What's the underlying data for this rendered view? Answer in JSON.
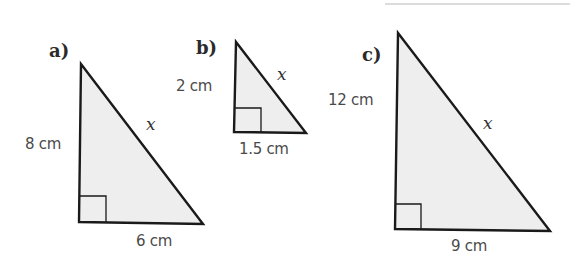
{
  "colors": {
    "fill": "#eeeeee",
    "stroke": "#1a1a1a",
    "text": "#4a4a4a"
  },
  "triangles": [
    {
      "label": "a)",
      "vertical_side": "8 cm",
      "horizontal_side": "6 cm",
      "hypotenuse": "x"
    },
    {
      "label": "b)",
      "vertical_side": "2 cm",
      "horizontal_side": "1.5 cm",
      "hypotenuse": "x"
    },
    {
      "label": "c)",
      "vertical_side": "12 cm",
      "horizontal_side": "9 cm",
      "hypotenuse": "x"
    }
  ]
}
